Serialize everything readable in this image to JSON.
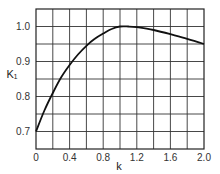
{
  "chart_data": {
    "type": "line",
    "title": "",
    "xlabel": "k",
    "ylabel": "K₁",
    "xlim": [
      0,
      2.0
    ],
    "ylim": [
      0.65,
      1.05
    ],
    "grid": true,
    "legend": null,
    "x_ticks": [
      "0",
      "0.4",
      "0.8",
      "1.2",
      "1.6",
      "2.0"
    ],
    "y_ticks": [
      "0.7",
      "0.8",
      "0.9",
      "1.0"
    ],
    "series": [
      {
        "name": "K1",
        "x": [
          0,
          0.1,
          0.2,
          0.3,
          0.4,
          0.5,
          0.6,
          0.7,
          0.8,
          0.9,
          1.0,
          1.1,
          1.2,
          1.4,
          1.6,
          1.8,
          2.0
        ],
        "values": [
          0.7,
          0.76,
          0.81,
          0.855,
          0.89,
          0.92,
          0.945,
          0.965,
          0.98,
          0.993,
          1.0,
          1.0,
          0.998,
          0.99,
          0.978,
          0.965,
          0.95
        ]
      }
    ]
  },
  "colors": {
    "line": "#111111",
    "grid": "#333333",
    "background": "#ffffff"
  }
}
